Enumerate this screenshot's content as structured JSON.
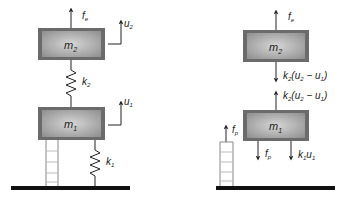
{
  "diagram": {
    "colors": {
      "box_outer": "#6b6b6b",
      "box_inner_edge": "#8a8a8a",
      "box_inner_center": "#cfcfcf",
      "line": "#222222",
      "ground": "#111111",
      "ladder": "#888888"
    },
    "left": {
      "mass_top": {
        "label": "m",
        "sub": "2"
      },
      "mass_bottom": {
        "label": "m",
        "sub": "1"
      },
      "force_top": {
        "label": "f",
        "sub": "e"
      },
      "disp_top": {
        "label": "u",
        "sub": "2"
      },
      "disp_bottom": {
        "label": "u",
        "sub": "1"
      },
      "spring_mid": {
        "label": "k",
        "sub": "2"
      },
      "spring_base": {
        "label": "k",
        "sub": "1"
      }
    },
    "right": {
      "mass_top": {
        "label": "m",
        "sub": "2"
      },
      "mass_bottom": {
        "label": "m",
        "sub": "1"
      },
      "force_top": {
        "label": "f",
        "sub": "e"
      },
      "force_m2_down": {
        "k": "k",
        "ksub": "2",
        "open": "(u",
        "a": "2",
        "minus": " − u",
        "b": "1",
        "close": ")"
      },
      "force_m1_up": {
        "k": "k",
        "ksub": "2",
        "open": "(u",
        "a": "2",
        "minus": " − u",
        "b": "1",
        "close": ")"
      },
      "force_fp_down": {
        "label": "f",
        "sub": "p"
      },
      "force_k1u1_down": {
        "k": "k",
        "ksub": "1",
        "u": "u",
        "usub": "1"
      },
      "force_fp_up": {
        "label": "f",
        "sub": "p"
      }
    }
  }
}
